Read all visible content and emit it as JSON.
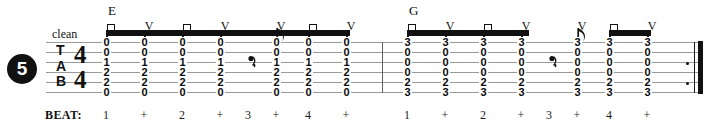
{
  "exercise": {
    "number": "5"
  },
  "direction": {
    "text": "clean"
  },
  "clef": {
    "letters": [
      "T",
      "A",
      "B"
    ]
  },
  "time_signature": {
    "numerator": "4",
    "denominator": "4"
  },
  "beat_ruler": {
    "title": "BEAT:",
    "labels": [
      "1",
      "+",
      "2",
      "+",
      "3",
      "+",
      "4",
      "+",
      "1",
      "+",
      "2",
      "+",
      "3",
      "+",
      "4",
      "+"
    ]
  },
  "strings": [
    "e",
    "B",
    "G",
    "D",
    "A",
    "E"
  ],
  "colors": {
    "ink": "#111111",
    "staff_line": "#9a9a9a",
    "barline": "#5e5e5e",
    "paper": "#ffffff"
  },
  "measures": [
    {
      "index": 1,
      "chord": "E",
      "chord_x": 108,
      "columns": [
        {
          "beat": "1",
          "x": 106,
          "frets": [
            "0",
            "0",
            "1",
            "2",
            "2",
            "0"
          ],
          "stroke": "down"
        },
        {
          "beat": "+",
          "x": 144,
          "frets": [
            "0",
            "0",
            "1",
            "2",
            "2",
            "0"
          ],
          "stroke": "up"
        },
        {
          "beat": "2",
          "x": 182,
          "frets": [
            "0",
            "0",
            "1",
            "2",
            "2",
            "0"
          ],
          "stroke": "down"
        },
        {
          "beat": "+",
          "x": 220,
          "frets": [
            "0",
            "0",
            "1",
            "2",
            "2",
            "0"
          ],
          "stroke": "up"
        },
        {
          "beat": "3",
          "x": 248,
          "frets": [],
          "rest": "quarter"
        },
        {
          "beat": "+",
          "x": 276,
          "frets": [
            "0",
            "0",
            "1",
            "2",
            "2",
            "0"
          ],
          "stroke": "up",
          "flag": true
        },
        {
          "beat": "4",
          "x": 308,
          "frets": [
            "0",
            "0",
            "1",
            "2",
            "2",
            "0"
          ],
          "stroke": "down"
        },
        {
          "beat": "+",
          "x": 346,
          "frets": [
            "0",
            "0",
            "1",
            "2",
            "2",
            "0"
          ],
          "stroke": "up"
        }
      ],
      "beams": [
        {
          "x": 106,
          "width": 244
        },
        {
          "x": 308,
          "width": 42
        }
      ]
    },
    {
      "index": 2,
      "chord": "G",
      "chord_x": 409,
      "columns": [
        {
          "beat": "1",
          "x": 407,
          "frets": [
            "3",
            "0",
            "0",
            "0",
            "2",
            "3"
          ],
          "stroke": "down"
        },
        {
          "beat": "+",
          "x": 445,
          "frets": [
            "3",
            "0",
            "0",
            "0",
            "2",
            "3"
          ],
          "stroke": "up"
        },
        {
          "beat": "2",
          "x": 483,
          "frets": [
            "3",
            "0",
            "0",
            "0",
            "2",
            "3"
          ],
          "stroke": "down"
        },
        {
          "beat": "+",
          "x": 521,
          "frets": [
            "3",
            "0",
            "0",
            "0",
            "2",
            "3"
          ],
          "stroke": "up"
        },
        {
          "beat": "3",
          "x": 549,
          "frets": [],
          "rest": "quarter"
        },
        {
          "beat": "+",
          "x": 577,
          "frets": [
            "3",
            "0",
            "0",
            "0",
            "2",
            "3"
          ],
          "stroke": "up",
          "flag": true
        },
        {
          "beat": "4",
          "x": 609,
          "frets": [
            "3",
            "0",
            "0",
            "0",
            "2",
            "3"
          ],
          "stroke": "down"
        },
        {
          "beat": "+",
          "x": 647,
          "frets": [
            "3",
            "0",
            "0",
            "0",
            "2",
            "3"
          ],
          "stroke": "up"
        }
      ],
      "beams": [
        {
          "x": 407,
          "width": 122
        },
        {
          "x": 609,
          "width": 42
        }
      ]
    }
  ],
  "barlines": [
    {
      "x": 382
    }
  ],
  "ending": {
    "type": "repeat-end",
    "thin_x": 694,
    "thick_x": 698,
    "dots_x": 686
  }
}
